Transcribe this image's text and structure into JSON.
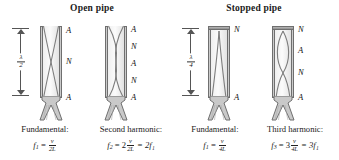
{
  "figure": {
    "headers": {
      "open": "Open pipe",
      "stopped": "Stopped pipe"
    },
    "dimension_labels": {
      "open": {
        "numerator": "λ",
        "denominator": "2"
      },
      "stopped": {
        "numerator": "λ",
        "denominator": "4"
      }
    },
    "panels": [
      {
        "id": "open-fundamental",
        "pipe_type": "open",
        "caption": "Fundamental:",
        "node_labels": [
          "A",
          "N",
          "A"
        ],
        "equation": {
          "symbol": "f",
          "sub": "1",
          "eq": "=",
          "coefficient": "",
          "num": "v",
          "den": "2L",
          "tail": ""
        }
      },
      {
        "id": "open-second-harmonic",
        "pipe_type": "open",
        "caption": "Second harmonic:",
        "node_labels": [
          "A",
          "N",
          "A",
          "N",
          "A"
        ],
        "equation": {
          "symbol": "f",
          "sub": "2",
          "eq": "=",
          "coefficient": "2",
          "num": "v",
          "den": "2L",
          "tail": "= 2f₁"
        }
      },
      {
        "id": "stopped-fundamental",
        "pipe_type": "stopped",
        "caption": "Fundamental:",
        "node_labels": [
          "N",
          "A"
        ],
        "equation": {
          "symbol": "f",
          "sub": "1",
          "eq": "=",
          "coefficient": "",
          "num": "v",
          "den": "4L",
          "tail": ""
        }
      },
      {
        "id": "stopped-third-harmonic",
        "pipe_type": "stopped",
        "caption": "Third harmonic:",
        "node_labels": [
          "N",
          "A",
          "N",
          "A"
        ],
        "equation": {
          "symbol": "f",
          "sub": "3",
          "eq": "=",
          "coefficient": "3",
          "num": "v",
          "den": "4L",
          "tail": "= 3f₁"
        }
      }
    ],
    "colors": {
      "wall": "#8d8d8d",
      "wall_outline": "#6f6f6f",
      "bore": "#f2f2f2",
      "wave": "#7a7a7a",
      "text": "#1a1a1a",
      "dimension_line": "#555555"
    }
  }
}
